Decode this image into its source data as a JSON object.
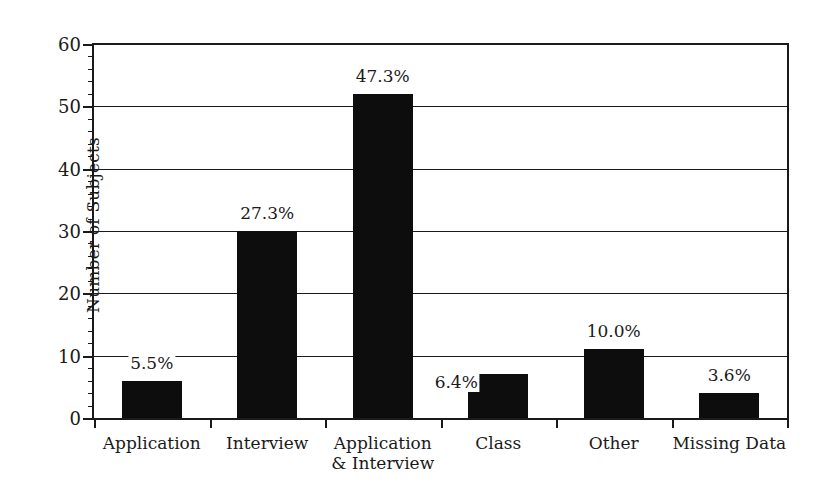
{
  "chart_data": {
    "type": "bar",
    "title": "",
    "subtitle": "",
    "xlabel": "",
    "ylabel": "Number of Subjects",
    "ylim": [
      0,
      60
    ],
    "ytick_step": 10,
    "yminor_step": 2,
    "grid": "horizontal-major",
    "legend": "none",
    "bar_color": "#0d0d0d",
    "axis_color": "#1a1a1a",
    "background": "#ffffff",
    "categories": [
      "Application",
      "Interview",
      "Application\n& Interview",
      "Class",
      "Other",
      "Missing Data"
    ],
    "values": [
      6,
      30,
      52,
      7,
      11,
      4
    ],
    "data_labels": [
      "5.5%",
      "27.3%",
      "47.3%",
      "6.4%",
      "10.0%",
      "3.6%"
    ],
    "ytick_labels": [
      "0",
      "10",
      "20",
      "30",
      "40",
      "50",
      "60"
    ]
  },
  "axis": {
    "y_label": "Number of Subjects",
    "y_ticks": [
      {
        "value": 60,
        "label": "60"
      },
      {
        "value": 50,
        "label": "50"
      },
      {
        "value": 40,
        "label": "40"
      },
      {
        "value": 30,
        "label": "30"
      },
      {
        "value": 20,
        "label": "20"
      },
      {
        "value": 10,
        "label": "10"
      },
      {
        "value": 0,
        "label": "0"
      }
    ]
  },
  "bars": [
    {
      "label_line1": "Application",
      "label_line2": "",
      "value": 6,
      "pct": "5.5%"
    },
    {
      "label_line1": "Interview",
      "label_line2": "",
      "value": 30,
      "pct": "27.3%"
    },
    {
      "label_line1": "Application",
      "label_line2": "& Interview",
      "value": 52,
      "pct": "47.3%"
    },
    {
      "label_line1": "Class",
      "label_line2": "",
      "value": 7,
      "pct": "6.4%"
    },
    {
      "label_line1": "Other",
      "label_line2": "",
      "value": 11,
      "pct": "10.0%"
    },
    {
      "label_line1": "Missing Data",
      "label_line2": "",
      "value": 4,
      "pct": "3.6%"
    }
  ]
}
